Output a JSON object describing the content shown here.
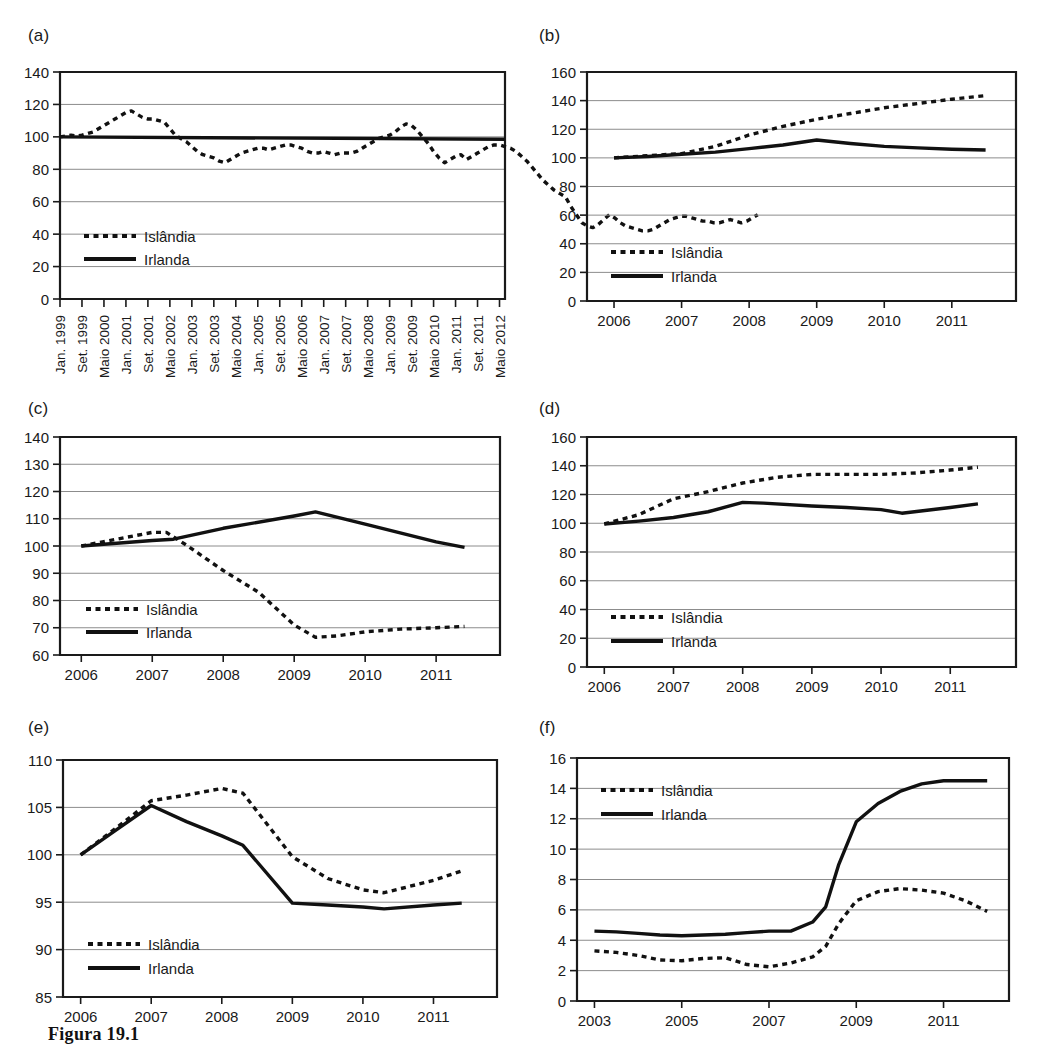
{
  "caption": "Figura 19.1",
  "legend": {
    "iceland": "Islândia",
    "ireland": "Irlanda"
  },
  "panels": {
    "a": {
      "label": "(a)"
    },
    "b": {
      "label": "(b)"
    },
    "c": {
      "label": "(c)"
    },
    "d": {
      "label": "(d)"
    },
    "e": {
      "label": "(e)"
    },
    "f": {
      "label": "(f)"
    }
  },
  "chart_data": [
    {
      "panel": "(a)",
      "type": "line",
      "title": "",
      "xlabel": "",
      "ylabel": "",
      "ylim": [
        0,
        140
      ],
      "yticks": [
        0,
        20,
        40,
        60,
        80,
        100,
        120,
        140
      ],
      "grid": true,
      "legend_position": "inside-lower-left",
      "xtick_labels": [
        "Jan. 1999",
        "Set. 1999",
        "Maio 2000",
        "Jan. 2001",
        "Set. 2001",
        "Maio 2002",
        "Jan. 2003",
        "Set. 2003",
        "Maio 2004",
        "Jan. 2005",
        "Set. 2005",
        "Maio 2006",
        "Jan. 2007",
        "Set. 2007",
        "Maio 2008",
        "Jan. 2009",
        "Set. 2009",
        "Maio 2010",
        "Jan. 2011",
        "Set. 2011",
        "Maio 2012"
      ],
      "series": [
        {
          "name": "Islândia",
          "style": "dotted",
          "x": [
            0,
            1,
            2,
            3,
            4,
            5,
            6,
            7,
            8,
            9,
            10,
            11,
            12,
            13,
            14,
            15,
            16,
            17,
            18,
            19,
            20,
            21,
            22,
            23,
            24,
            25,
            26,
            27,
            28,
            29,
            30,
            31,
            32,
            33,
            34,
            35,
            36,
            37,
            38,
            39,
            40,
            41,
            42,
            43,
            44,
            45,
            46,
            47,
            48,
            49,
            50,
            51,
            52,
            53,
            54,
            55,
            56,
            57,
            58,
            59,
            60,
            61,
            62,
            63,
            64,
            65,
            66,
            67,
            68,
            69,
            70,
            71,
            72,
            73,
            74,
            75,
            76,
            77,
            78,
            79,
            80,
            81
          ],
          "values": [
            100,
            100.5,
            101,
            100.5,
            101,
            102,
            103,
            105,
            107,
            109,
            111,
            113,
            115,
            116,
            114,
            112,
            111,
            111,
            110,
            109,
            105,
            101,
            99,
            97,
            94,
            91,
            89,
            88,
            87,
            85,
            84,
            86,
            88,
            90,
            91,
            92,
            93,
            93,
            92,
            93,
            94,
            95,
            95,
            94,
            93,
            91,
            90,
            90,
            91,
            90,
            89,
            90,
            90,
            90,
            91,
            93,
            95,
            97,
            99,
            100,
            101,
            103,
            106,
            108,
            107,
            104,
            100,
            96,
            91,
            87,
            84,
            86,
            88,
            89,
            86,
            88,
            90,
            92,
            94,
            95,
            95,
            94
          ],
          "values_tail": [
            93,
            91,
            88,
            85,
            81,
            77,
            73,
            70,
            67,
            65,
            63,
            57,
            52,
            47,
            45,
            44,
            46,
            49,
            52,
            50,
            47,
            45,
            44,
            43,
            42,
            42,
            43,
            45,
            47,
            49,
            50,
            51,
            51,
            50,
            49,
            48,
            48,
            47,
            47,
            48,
            49,
            48,
            47,
            48,
            50,
            52
          ]
        },
        {
          "name": "Irlanda",
          "style": "solid",
          "x": [
            0,
            81
          ],
          "values": [
            100,
            98.5
          ]
        }
      ]
    },
    {
      "panel": "(b)",
      "type": "line",
      "ylim": [
        0,
        160
      ],
      "yticks": [
        0,
        20,
        40,
        60,
        80,
        100,
        120,
        140,
        160
      ],
      "xticks": [
        2006,
        2007,
        2008,
        2009,
        2010,
        2011
      ],
      "xtick_labels": [
        "2006",
        "2007",
        "2008",
        "2009",
        "2010",
        "2011"
      ],
      "grid": true,
      "legend_position": "inside-lower-left",
      "series": [
        {
          "name": "Islândia",
          "style": "dotted",
          "x": [
            2006,
            2006.5,
            2007,
            2007.5,
            2008,
            2008.5,
            2009,
            2009.5,
            2010,
            2010.5,
            2011,
            2011.5
          ],
          "values": [
            100,
            101.5,
            103,
            108,
            116,
            122,
            127,
            131,
            135,
            138,
            141,
            143.5
          ]
        },
        {
          "name": "Irlanda",
          "style": "solid",
          "x": [
            2006,
            2006.5,
            2007,
            2007.5,
            2008,
            2008.5,
            2009,
            2009.5,
            2010,
            2010.5,
            2011,
            2011.5
          ],
          "values": [
            100,
            101,
            102.5,
            104,
            106.5,
            109,
            112.5,
            110,
            108,
            107,
            106,
            105.5
          ]
        }
      ]
    },
    {
      "panel": "(c)",
      "type": "line",
      "ylim": [
        60,
        140
      ],
      "yticks": [
        60,
        70,
        80,
        90,
        100,
        110,
        120,
        130,
        140
      ],
      "xticks": [
        2006,
        2007,
        2008,
        2009,
        2010,
        2011
      ],
      "xtick_labels": [
        "2006",
        "2007",
        "2008",
        "2009",
        "2010",
        "2011"
      ],
      "grid": true,
      "legend_position": "inside-lower-left",
      "series": [
        {
          "name": "Islândia",
          "style": "dotted",
          "x": [
            2006,
            2006.3,
            2006.6,
            2007,
            2007.2,
            2007.5,
            2008,
            2008.5,
            2009,
            2009.3,
            2009.6,
            2010,
            2010.5,
            2011,
            2011.4
          ],
          "values": [
            100,
            101.5,
            103,
            105,
            105,
            100,
            91,
            83,
            71,
            66.5,
            67,
            68.5,
            69.5,
            70,
            70.5
          ]
        },
        {
          "name": "Irlanda",
          "style": "solid",
          "x": [
            2006,
            2006.5,
            2007,
            2007.3,
            2008,
            2009,
            2009.3,
            2010,
            2011,
            2011.4
          ],
          "values": [
            100,
            101,
            102,
            102.5,
            106.5,
            111,
            112.5,
            108,
            101.5,
            99.5
          ]
        }
      ]
    },
    {
      "panel": "(d)",
      "type": "line",
      "ylim": [
        0,
        160
      ],
      "yticks": [
        0,
        20,
        40,
        60,
        80,
        100,
        120,
        140,
        160
      ],
      "xticks": [
        2006,
        2007,
        2008,
        2009,
        2010,
        2011
      ],
      "xtick_labels": [
        "2006",
        "2007",
        "2008",
        "2009",
        "2010",
        "2011"
      ],
      "grid": true,
      "legend_position": "inside-lower-left",
      "series": [
        {
          "name": "Islândia",
          "style": "dotted",
          "x": [
            2006,
            2006.5,
            2007,
            2007.5,
            2008,
            2008.5,
            2009,
            2009.5,
            2010,
            2010.5,
            2011,
            2011.4
          ],
          "values": [
            99.5,
            106,
            117,
            122,
            128,
            132,
            134,
            134,
            134,
            135,
            137,
            139
          ]
        },
        {
          "name": "Irlanda",
          "style": "solid",
          "x": [
            2006,
            2006.5,
            2007,
            2007.5,
            2008,
            2008.3,
            2009,
            2009.5,
            2010,
            2010.3,
            2011,
            2011.4
          ],
          "values": [
            99.5,
            101.5,
            104,
            108,
            114.5,
            114,
            112,
            111,
            109.5,
            107,
            111,
            113.5
          ]
        }
      ]
    },
    {
      "panel": "(e)",
      "type": "line",
      "ylim": [
        85,
        110
      ],
      "yticks": [
        85,
        90,
        95,
        100,
        105,
        110
      ],
      "xticks": [
        2006,
        2007,
        2008,
        2009,
        2010,
        2011
      ],
      "xtick_labels": [
        "2006",
        "2007",
        "2008",
        "2009",
        "2010",
        "2011"
      ],
      "grid": true,
      "legend_position": "inside-lower-left",
      "series": [
        {
          "name": "Islândia",
          "style": "dotted",
          "x": [
            2006,
            2006.5,
            2007,
            2007.5,
            2008,
            2008.3,
            2009,
            2009.5,
            2010,
            2010.3,
            2011,
            2011.4
          ],
          "values": [
            100,
            102.8,
            105.7,
            106.3,
            107,
            106.5,
            99.8,
            97.5,
            96.3,
            96,
            97.3,
            98.3
          ]
        },
        {
          "name": "Irlanda",
          "style": "solid",
          "x": [
            2006,
            2006.5,
            2007,
            2007.5,
            2008,
            2008.3,
            2009,
            2009.5,
            2010,
            2010.3,
            2011,
            2011.4
          ],
          "values": [
            100,
            102.6,
            105.2,
            103.5,
            102,
            101,
            94.9,
            94.7,
            94.5,
            94.3,
            94.7,
            94.9
          ]
        }
      ]
    },
    {
      "panel": "(f)",
      "type": "line",
      "ylim": [
        0,
        16
      ],
      "yticks": [
        0,
        2,
        4,
        6,
        8,
        10,
        12,
        14,
        16
      ],
      "xticks": [
        2003,
        2005,
        2007,
        2009,
        2011
      ],
      "xtick_labels": [
        "2003",
        "2005",
        "2007",
        "2009",
        "2011"
      ],
      "grid": true,
      "legend_position": "inside-upper-left",
      "series": [
        {
          "name": "Islândia",
          "style": "dotted",
          "x": [
            2003,
            2003.5,
            2004,
            2004.5,
            2005,
            2005.5,
            2006,
            2006.5,
            2007,
            2007.5,
            2008,
            2008.3,
            2008.6,
            2009,
            2009.5,
            2010,
            2010.5,
            2011,
            2011.5,
            2012
          ],
          "values": [
            3.3,
            3.2,
            3.0,
            2.7,
            2.65,
            2.8,
            2.85,
            2.4,
            2.25,
            2.5,
            2.9,
            3.6,
            5.1,
            6.6,
            7.2,
            7.4,
            7.3,
            7.1,
            6.6,
            5.9
          ]
        },
        {
          "name": "Irlanda",
          "style": "solid",
          "x": [
            2003,
            2003.5,
            2004,
            2004.5,
            2005,
            2005.5,
            2006,
            2006.5,
            2007,
            2007.5,
            2008,
            2008.3,
            2008.6,
            2009,
            2009.5,
            2010,
            2010.5,
            2011,
            2011.5,
            2012
          ],
          "values": [
            4.6,
            4.55,
            4.45,
            4.35,
            4.3,
            4.35,
            4.4,
            4.5,
            4.6,
            4.6,
            5.2,
            6.2,
            9.0,
            11.8,
            13.0,
            13.8,
            14.3,
            14.5,
            14.5,
            14.5
          ]
        }
      ]
    }
  ]
}
